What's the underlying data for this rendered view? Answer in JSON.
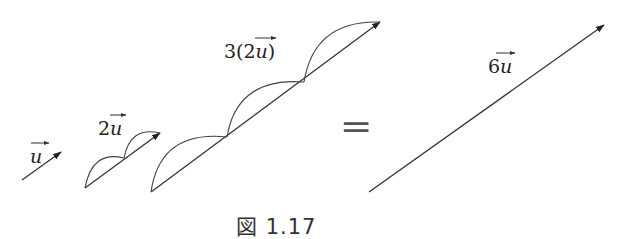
{
  "figure": {
    "caption": "図 1.17",
    "equals_sign": "="
  },
  "vectors": [
    {
      "id": "u",
      "label_coef": "",
      "label_var": "u",
      "segments": 1
    },
    {
      "id": "2u",
      "label_coef": "2",
      "label_var": "u",
      "segments": 2
    },
    {
      "id": "3(2u)",
      "label_prefix": "3(",
      "label_coef": "2",
      "label_var": "u",
      "label_suffix": ")",
      "segments": 3
    },
    {
      "id": "6u",
      "label_coef": "6",
      "label_var": "u",
      "segments": 1
    }
  ],
  "colors": {
    "stroke": "#333333",
    "text": "#222222"
  }
}
